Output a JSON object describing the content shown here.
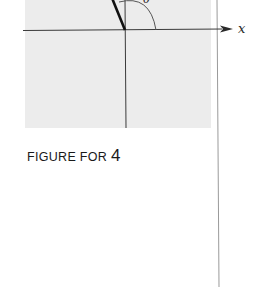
{
  "figure": {
    "axis_label_x": "x",
    "angle_label": "θ",
    "caption_prefix": "FIGURE FOR",
    "caption_number": "4"
  },
  "colors": {
    "panel": "#ececec",
    "ink": "#2a2a2a",
    "arc": "#555555",
    "margin_line": "#9a9a9a"
  }
}
